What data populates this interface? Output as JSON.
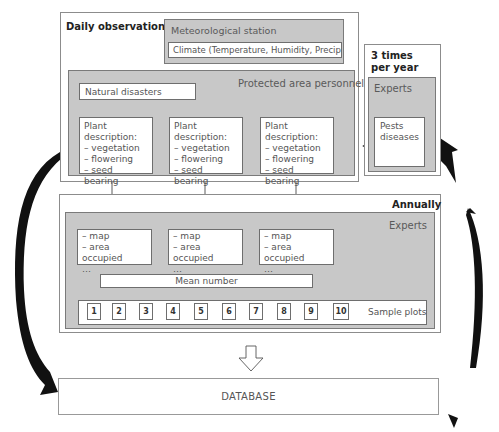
{
  "daily": {
    "label": "Daily observations",
    "met_station": {
      "label": "Meteorological station",
      "climate": "Climate (Temperature, Humidity, Precipitation)"
    },
    "personnel": {
      "label": "Protected area personnel",
      "natural_disasters": "Natural disasters",
      "plant_descriptions": [
        {
          "title": "Plant description:",
          "items": [
            "– vegetation",
            "– flowering",
            "– seed bearing"
          ]
        },
        {
          "title": "Plant description:",
          "items": [
            "– vegetation",
            "– flowering",
            "– seed bearing"
          ]
        },
        {
          "title": "Plant description:",
          "items": [
            "– vegetation",
            "– flowering",
            "– seed bearing"
          ]
        }
      ]
    }
  },
  "three_times": {
    "label_line1": "3 times",
    "label_line2": "per year",
    "experts": {
      "label": "Experts",
      "pests_line1": "Pests",
      "pests_line2": "diseases"
    }
  },
  "annually": {
    "label": "Annually",
    "experts": {
      "label": "Experts",
      "maps": [
        {
          "items": [
            "– map",
            "– area occupied",
            "…"
          ]
        },
        {
          "items": [
            "– map",
            "– area occupied",
            "…"
          ]
        },
        {
          "items": [
            "– map",
            "– area occupied",
            "…"
          ]
        }
      ],
      "mean_number": "Mean number",
      "sample_plots_label": "Sample plots",
      "sample_plots": [
        "1",
        "2",
        "3",
        "4",
        "5",
        "6",
        "7",
        "8",
        "9",
        "10"
      ]
    }
  },
  "database": "DATABASE"
}
